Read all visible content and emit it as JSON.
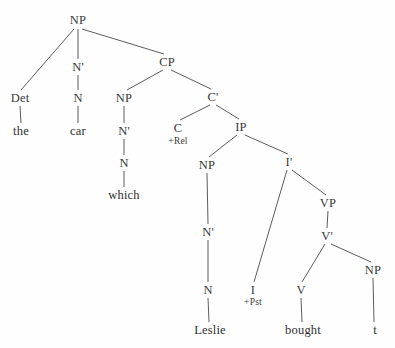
{
  "diagram": {
    "type": "syntax-tree",
    "sentence": "the car which Leslie bought t",
    "background_color": "#fefefe",
    "line_color": "#4a4a4a",
    "text_color": "#3a3a3a",
    "nodes": [
      {
        "id": "np-top",
        "label": "NP",
        "x": 78,
        "y": 20,
        "kind": "category"
      },
      {
        "id": "det",
        "label": "Det",
        "x": 20,
        "y": 98,
        "kind": "category"
      },
      {
        "id": "the",
        "label": "the",
        "x": 21,
        "y": 131,
        "kind": "terminal"
      },
      {
        "id": "nbar-car",
        "label": "N'",
        "x": 78,
        "y": 67,
        "kind": "category"
      },
      {
        "id": "n-car",
        "label": "N",
        "x": 78,
        "y": 98,
        "kind": "category"
      },
      {
        "id": "car",
        "label": "car",
        "x": 78,
        "y": 131,
        "kind": "terminal"
      },
      {
        "id": "cp",
        "label": "CP",
        "x": 167,
        "y": 62,
        "kind": "category"
      },
      {
        "id": "np-which",
        "label": "NP",
        "x": 124,
        "y": 98,
        "kind": "category"
      },
      {
        "id": "nbar-which",
        "label": "N'",
        "x": 124,
        "y": 131,
        "kind": "category"
      },
      {
        "id": "n-which",
        "label": "N",
        "x": 124,
        "y": 163,
        "kind": "category"
      },
      {
        "id": "which",
        "label": "which",
        "x": 124,
        "y": 195,
        "kind": "terminal"
      },
      {
        "id": "cbar",
        "label": "C'",
        "x": 213,
        "y": 97,
        "kind": "category"
      },
      {
        "id": "c",
        "label": "C",
        "x": 178,
        "y": 128,
        "kind": "category"
      },
      {
        "id": "rel",
        "label": "+Rel",
        "x": 178,
        "y": 142,
        "kind": "feature"
      },
      {
        "id": "ip",
        "label": "IP",
        "x": 241,
        "y": 127,
        "kind": "category"
      },
      {
        "id": "np-leslie",
        "label": "NP",
        "x": 207,
        "y": 165,
        "kind": "category"
      },
      {
        "id": "nbar-leslie",
        "label": "N'",
        "x": 208,
        "y": 232,
        "kind": "category"
      },
      {
        "id": "n-leslie",
        "label": "N",
        "x": 208,
        "y": 290,
        "kind": "category"
      },
      {
        "id": "leslie",
        "label": "Leslie",
        "x": 210,
        "y": 330,
        "kind": "terminal"
      },
      {
        "id": "ibar",
        "label": "I'",
        "x": 289,
        "y": 162,
        "kind": "category"
      },
      {
        "id": "i",
        "label": "I",
        "x": 253,
        "y": 290,
        "kind": "category"
      },
      {
        "id": "pst",
        "label": "+Pst",
        "x": 253,
        "y": 303,
        "kind": "feature"
      },
      {
        "id": "vp",
        "label": "VP",
        "x": 328,
        "y": 203,
        "kind": "category"
      },
      {
        "id": "vbar",
        "label": "V'",
        "x": 327,
        "y": 236,
        "kind": "category"
      },
      {
        "id": "v",
        "label": "V",
        "x": 301,
        "y": 290,
        "kind": "category"
      },
      {
        "id": "bought",
        "label": "bought",
        "x": 303,
        "y": 330,
        "kind": "terminal"
      },
      {
        "id": "np-trace",
        "label": "NP",
        "x": 373,
        "y": 270,
        "kind": "category"
      },
      {
        "id": "trace",
        "label": "t",
        "x": 375,
        "y": 330,
        "kind": "terminal"
      }
    ],
    "edges": [
      {
        "from": "np-top",
        "to": "det",
        "x1": 74,
        "y1": 29,
        "x2": 21,
        "y2": 90
      },
      {
        "from": "np-top",
        "to": "nbar-car",
        "x1": 78,
        "y1": 29,
        "x2": 78,
        "y2": 59
      },
      {
        "from": "np-top",
        "to": "cp",
        "x1": 82,
        "y1": 29,
        "x2": 164,
        "y2": 54
      },
      {
        "from": "det",
        "to": "the",
        "x1": 20,
        "y1": 106,
        "x2": 21,
        "y2": 123
      },
      {
        "from": "nbar-car",
        "to": "n-car",
        "x1": 78,
        "y1": 75,
        "x2": 78,
        "y2": 90
      },
      {
        "from": "n-car",
        "to": "car",
        "x1": 78,
        "y1": 106,
        "x2": 78,
        "y2": 123
      },
      {
        "from": "cp",
        "to": "np-which",
        "x1": 163,
        "y1": 70,
        "x2": 127,
        "y2": 90
      },
      {
        "from": "cp",
        "to": "cbar",
        "x1": 171,
        "y1": 70,
        "x2": 211,
        "y2": 89
      },
      {
        "from": "np-which",
        "to": "nbar-which",
        "x1": 124,
        "y1": 106,
        "x2": 124,
        "y2": 123
      },
      {
        "from": "nbar-which",
        "to": "n-which",
        "x1": 124,
        "y1": 139,
        "x2": 124,
        "y2": 155
      },
      {
        "from": "n-which",
        "to": "which",
        "x1": 124,
        "y1": 171,
        "x2": 124,
        "y2": 187
      },
      {
        "from": "cbar",
        "to": "c",
        "x1": 210,
        "y1": 105,
        "x2": 180,
        "y2": 120
      },
      {
        "from": "cbar",
        "to": "ip",
        "x1": 216,
        "y1": 105,
        "x2": 239,
        "y2": 119
      },
      {
        "from": "ip",
        "to": "np-leslie",
        "x1": 237,
        "y1": 135,
        "x2": 209,
        "y2": 157
      },
      {
        "from": "ip",
        "to": "ibar",
        "x1": 245,
        "y1": 135,
        "x2": 288,
        "y2": 154
      },
      {
        "from": "np-leslie",
        "to": "nbar-leslie",
        "x1": 207,
        "y1": 173,
        "x2": 208,
        "y2": 224
      },
      {
        "from": "nbar-leslie",
        "to": "n-leslie",
        "x1": 208,
        "y1": 240,
        "x2": 208,
        "y2": 282
      },
      {
        "from": "n-leslie",
        "to": "leslie",
        "x1": 208,
        "y1": 298,
        "x2": 209,
        "y2": 322
      },
      {
        "from": "ibar",
        "to": "i",
        "x1": 287,
        "y1": 170,
        "x2": 254,
        "y2": 282
      },
      {
        "from": "ibar",
        "to": "vp",
        "x1": 292,
        "y1": 170,
        "x2": 326,
        "y2": 195
      },
      {
        "from": "vp",
        "to": "vbar",
        "x1": 328,
        "y1": 211,
        "x2": 327,
        "y2": 228
      },
      {
        "from": "vbar",
        "to": "v",
        "x1": 325,
        "y1": 244,
        "x2": 302,
        "y2": 282
      },
      {
        "from": "vbar",
        "to": "np-trace",
        "x1": 331,
        "y1": 244,
        "x2": 371,
        "y2": 262
      },
      {
        "from": "v",
        "to": "bought",
        "x1": 301,
        "y1": 298,
        "x2": 302,
        "y2": 322
      },
      {
        "from": "np-trace",
        "to": "trace",
        "x1": 373,
        "y1": 278,
        "x2": 374,
        "y2": 322
      }
    ]
  }
}
